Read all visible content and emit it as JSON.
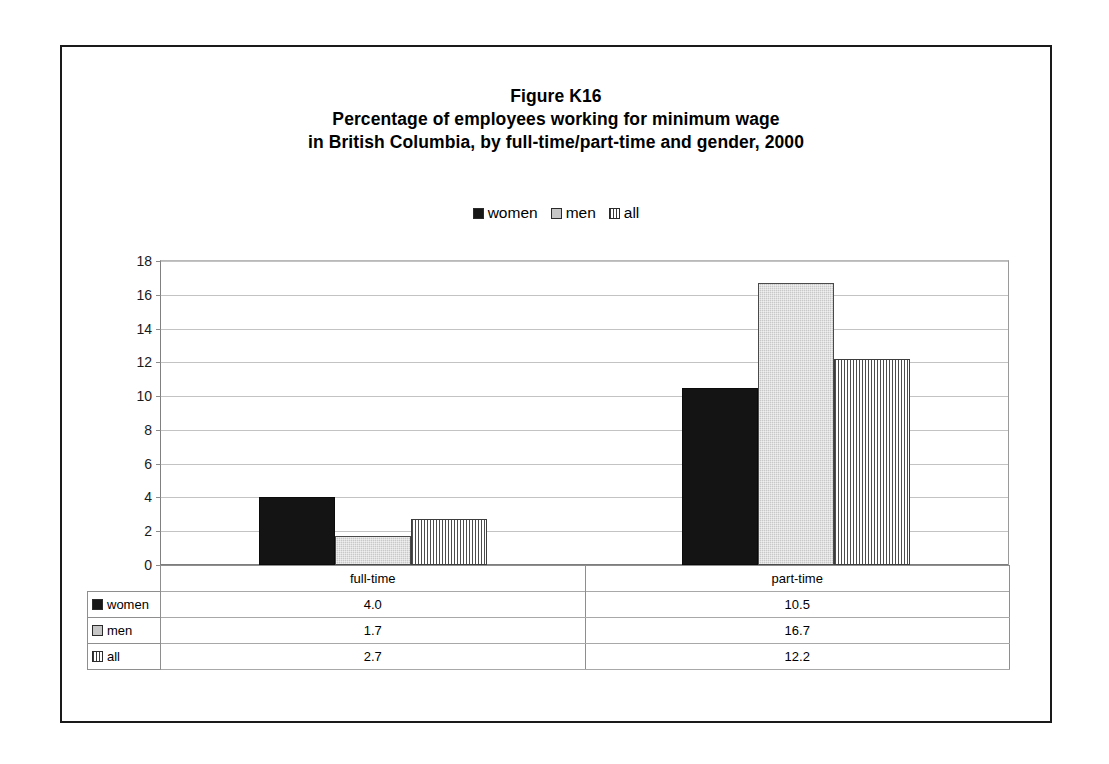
{
  "chart_data": {
    "type": "bar",
    "title": "Figure K16",
    "title_lines": [
      "Figure K16",
      "Percentage of employees working for minimum wage",
      "in British Columbia, by full-time/part-time and gender, 2000"
    ],
    "subtitle": "Percentage of employees working for minimum wage in British Columbia, by full-time/part-time and gender, 2000",
    "categories": [
      "full-time",
      "part-time"
    ],
    "series": [
      {
        "name": "women",
        "values": [
          4.0,
          10.5
        ],
        "labels": [
          "4.0",
          "10.5"
        ],
        "swatch": "solid-black"
      },
      {
        "name": "men",
        "values": [
          1.7,
          16.7
        ],
        "labels": [
          "1.7",
          "16.7"
        ],
        "swatch": "solid-gray"
      },
      {
        "name": "all",
        "values": [
          2.7,
          12.2
        ],
        "labels": [
          "2.7",
          "12.2"
        ],
        "swatch": "vertical-stripe"
      }
    ],
    "xlabel": "",
    "ylabel": "",
    "ylim": [
      0,
      18
    ],
    "ytick_step": 2,
    "yticks": [
      "18",
      "16",
      "14",
      "12",
      "10",
      "8",
      "6",
      "4",
      "2",
      "0"
    ],
    "ytick_values": [
      18,
      16,
      14,
      12,
      10,
      8,
      6,
      4,
      2,
      0
    ],
    "grid": true,
    "grid_axis": "y",
    "legend_position": "top-center",
    "data_table_visible": true
  },
  "legend": {
    "entries": [
      {
        "label": "women"
      },
      {
        "label": "men"
      },
      {
        "label": "all"
      }
    ]
  },
  "table": {
    "header_blank": "",
    "headers": [
      "full-time",
      "part-time"
    ],
    "rows": [
      {
        "series": "women",
        "values": [
          "4.0",
          "10.5"
        ]
      },
      {
        "series": "men",
        "values": [
          "1.7",
          "16.7"
        ]
      },
      {
        "series": "all",
        "values": [
          "2.7",
          "12.2"
        ]
      }
    ]
  },
  "colors": {
    "women": "#141414",
    "men": "#c8c8c8",
    "all_stripe": "#4d4d4d",
    "gridline": "#c3c3c3",
    "axis": "#7d7d7d",
    "frame": "#1a1a1a"
  }
}
